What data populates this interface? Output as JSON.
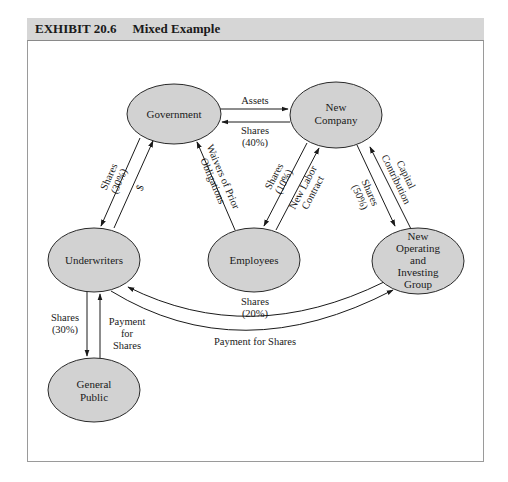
{
  "exhibit": {
    "number": "EXHIBIT 20.6",
    "title": "Mixed Example"
  },
  "colors": {
    "node_fill": "#d2d2d2",
    "node_stroke": "#2a2a2a",
    "header_bg": "#d6d6d6",
    "arrow": "#1a1a1a"
  },
  "nodes": {
    "government": {
      "label": "Government"
    },
    "new_company": {
      "line1": "New",
      "line2": "Company"
    },
    "underwriters": {
      "label": "Underwriters"
    },
    "employees": {
      "label": "Employees"
    },
    "new_group": {
      "line1": "New",
      "line2": "Operating",
      "line3": "and",
      "line4": "Investing",
      "line5": "Group"
    },
    "general_public": {
      "line1": "General",
      "line2": "Public"
    }
  },
  "edges": {
    "gov_to_newco": {
      "label": "Assets"
    },
    "newco_to_gov": {
      "line1": "Shares",
      "line2": "(40%)"
    },
    "gov_to_underwriters": {
      "line1": "Shares",
      "line2": "(30%)"
    },
    "underwriters_to_gov": {
      "label": "$"
    },
    "employees_to_gov": {
      "line1": "Waivers of Prior",
      "line2": "Obligations"
    },
    "newco_to_employees": {
      "line1": "Shares",
      "line2": "(10%)"
    },
    "employees_to_newco": {
      "line1": "New Labor",
      "line2": "Contract"
    },
    "newco_to_group": {
      "line1": "Shares",
      "line2": "(50%)"
    },
    "group_to_newco": {
      "line1": "Capital",
      "line2": "Contribution"
    },
    "group_to_underwriters": {
      "line1": "Shares",
      "line2": "(20%)"
    },
    "underwriters_to_group": {
      "label": "Payment for Shares"
    },
    "underwriters_to_public": {
      "line1": "Shares",
      "line2": "(30%)"
    },
    "public_to_underwriters": {
      "line1": "Payment",
      "line2": "for",
      "line3": "Shares"
    }
  }
}
